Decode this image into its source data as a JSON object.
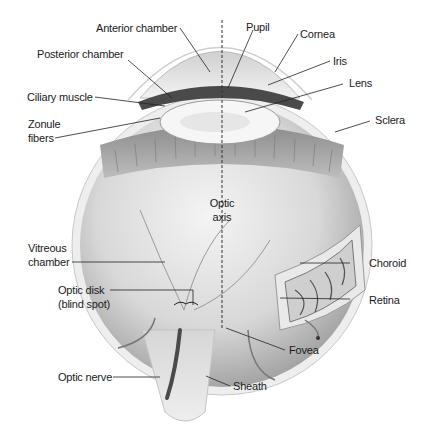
{
  "diagram": {
    "labels": {
      "anterior_chamber": "Anterior chamber",
      "pupil": "Pupil",
      "cornea": "Cornea",
      "posterior_chamber": "Posterior chamber",
      "iris": "Iris",
      "lens": "Lens",
      "ciliary_muscle": "Ciliary muscle",
      "zonule_fibers_1": "Zonule",
      "zonule_fibers_2": "fibers",
      "sclera": "Sclera",
      "optic_axis_1": "Optic",
      "optic_axis_2": "axis",
      "vitreous_chamber_1": "Vitreous",
      "vitreous_chamber_2": "chamber",
      "choroid": "Choroid",
      "optic_disk_1": "Optic disk",
      "optic_disk_2": "(blind spot)",
      "retina": "Retina",
      "fovea": "Fovea",
      "optic_nerve": "Optic nerve",
      "sheath": "Sheath"
    },
    "colors": {
      "background": "#ffffff",
      "label_text": "#1a1a1a",
      "leader_line": "#222222",
      "tissue_light": "#e6e6e6",
      "tissue_mid": "#b5b5b5",
      "tissue_dark": "#555555"
    }
  }
}
